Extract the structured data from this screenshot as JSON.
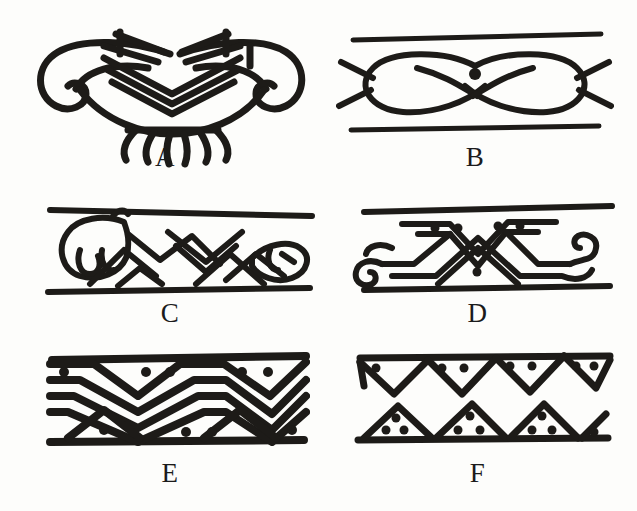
{
  "figure": {
    "background_color": "#fdfdfb",
    "ink_color": "#14120f",
    "layout": {
      "columns": 2,
      "rows": 3
    },
    "panels": [
      {
        "id": "A",
        "label": "A",
        "motif_name": "double-volute-insect-motif",
        "description": "Symmetrical abstract insect or butterfly form with inward scroll volutes at both ends, stacked nested chevrons across the centre and six downward tendril legs below",
        "has_border_lines": false,
        "dot_count": 0,
        "leg_count": 6,
        "chevron_lines": 3
      },
      {
        "id": "B",
        "label": "B",
        "motif_name": "crossed-ovals-infinity-motif",
        "description": "Two elongated ovals crossing at centre forming an infinity or figure-eight with a single solid dot above the crossing, framed by upper and lower straight border lines",
        "has_border_lines": true,
        "dot_count": 1,
        "oval_count": 2,
        "border_lines": 2
      },
      {
        "id": "C",
        "label": "C",
        "motif_name": "zigzag-with-animal-heads-motif",
        "description": "Band of interlocking angular zigzags and nested chevrons terminating in stylised animal or bird head forms at the left and right ends, framed by two border lines",
        "has_border_lines": true,
        "dot_count": 0,
        "animal_head_count": 2,
        "border_lines": 2
      },
      {
        "id": "D",
        "label": "D",
        "motif_name": "dotted-zigzag-with-scrolls-motif",
        "description": "Zigzag band of nested triangles with solid dots inside the upper triangles and one dot in the lower triangle, ending in spiral scroll volutes at both ends, framed by two border lines",
        "has_border_lines": true,
        "dot_count": 5,
        "scroll_count": 2,
        "border_lines": 2
      },
      {
        "id": "E",
        "label": "E",
        "motif_name": "dense-nested-chevron-band-motif",
        "description": "Tightly packed band of four nested chevron courses filling the full height between straight upper and lower border lines, with solid dots in the apex voids along the top and bottom edges",
        "has_border_lines": true,
        "dot_count": 9,
        "chevron_courses": 4,
        "border_lines": 2
      },
      {
        "id": "F",
        "label": "F",
        "motif_name": "dotted-triangle-rows-motif",
        "description": "Two separate rows: an upper row of pendant downward triangles each containing two dots hung from a straight line, and a lower row of upward triangles each containing three dots standing on a straight line",
        "has_border_lines": true,
        "dot_count": 17,
        "upper_triangles": 4,
        "lower_triangles": 4,
        "border_lines": 2
      }
    ]
  }
}
